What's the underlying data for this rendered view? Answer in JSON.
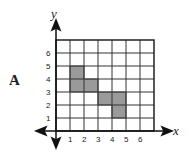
{
  "figure": {
    "label": "A",
    "x_axis_label": "x",
    "y_axis_label": "y",
    "x_ticks": [
      "1",
      "2",
      "3",
      "4",
      "5",
      "6"
    ],
    "y_ticks": [
      "1",
      "2",
      "3",
      "4",
      "5",
      "6"
    ],
    "grid": {
      "columns": 7,
      "rows": 7
    },
    "shaded_cells": [
      {
        "x": 1,
        "y": 4
      },
      {
        "x": 1,
        "y": 3
      },
      {
        "x": 2,
        "y": 3
      },
      {
        "x": 3,
        "y": 2
      },
      {
        "x": 4,
        "y": 2
      },
      {
        "x": 4,
        "y": 1
      }
    ],
    "colors": {
      "grid": "#333333",
      "shade": "#9a9a9a",
      "axis": "#111111"
    }
  }
}
